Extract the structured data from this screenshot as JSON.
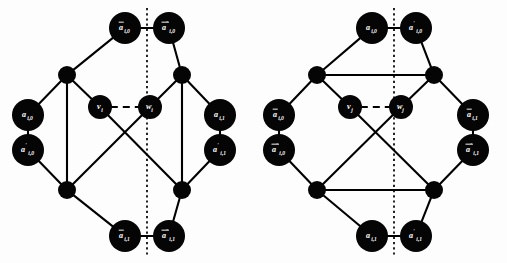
{
  "figure": {
    "kind": "graph-diagram-pair",
    "background_color": "#fdfdfd",
    "ink_color": "#000000",
    "node_fill": "#050505",
    "node_text_color": "#ffffff",
    "gadget_count": 2
  },
  "gadgets": [
    {
      "id": "left",
      "name": "variable-gadget-i",
      "center_subscript": "i",
      "connector_orientation": "vertical",
      "axis": {
        "type": "dotted",
        "orientation": "vertical"
      },
      "nodes": [
        {
          "key": "top_left",
          "base": "a",
          "bar": true,
          "prime": false,
          "sub": "i,0",
          "label": "ā_{i,0}",
          "cx": 125,
          "cy": 28,
          "r": 16
        },
        {
          "key": "top_right",
          "base": "a",
          "bar": true,
          "prime": true,
          "sub": "i,0",
          "label": "ā'_{i,0}",
          "cx": 169,
          "cy": 28,
          "r": 16
        },
        {
          "key": "hub_top_left",
          "base": "",
          "bar": false,
          "prime": false,
          "sub": "",
          "label": "",
          "cx": 67,
          "cy": 75,
          "r": 9
        },
        {
          "key": "hub_top_right",
          "base": "",
          "bar": false,
          "prime": false,
          "sub": "",
          "label": "",
          "cx": 182,
          "cy": 75,
          "r": 9
        },
        {
          "key": "side_left_up",
          "base": "a",
          "bar": false,
          "prime": false,
          "sub": "i,0",
          "label": "a_{i,0}",
          "cx": 28,
          "cy": 115,
          "r": 16
        },
        {
          "key": "side_left_dn",
          "base": "a",
          "bar": false,
          "prime": true,
          "sub": "i,0",
          "label": "a'_{i,0}",
          "cx": 28,
          "cy": 150,
          "r": 16
        },
        {
          "key": "center_v",
          "base": "v",
          "bar": false,
          "prime": false,
          "sub": "i",
          "label": "v_i",
          "cx": 100,
          "cy": 107,
          "r": 12
        },
        {
          "key": "center_w",
          "base": "w",
          "bar": false,
          "prime": false,
          "sub": "i",
          "label": "w_i",
          "cx": 150,
          "cy": 107,
          "r": 12
        },
        {
          "key": "side_right_up",
          "base": "a",
          "bar": false,
          "prime": false,
          "sub": "i,1",
          "label": "a_{i,1}",
          "cx": 220,
          "cy": 115,
          "r": 16
        },
        {
          "key": "side_right_dn",
          "base": "a",
          "bar": false,
          "prime": true,
          "sub": "i,1",
          "label": "a'_{i,1}",
          "cx": 220,
          "cy": 150,
          "r": 16
        },
        {
          "key": "hub_bot_left",
          "base": "",
          "bar": false,
          "prime": false,
          "sub": "",
          "label": "",
          "cx": 67,
          "cy": 190,
          "r": 9
        },
        {
          "key": "hub_bot_right",
          "base": "",
          "bar": false,
          "prime": false,
          "sub": "",
          "label": "",
          "cx": 182,
          "cy": 190,
          "r": 9
        },
        {
          "key": "bot_left",
          "base": "a",
          "bar": true,
          "prime": false,
          "sub": "i,1",
          "label": "ā_{i,1}",
          "cx": 125,
          "cy": 236,
          "r": 16
        },
        {
          "key": "bot_right",
          "base": "a",
          "bar": true,
          "prime": true,
          "sub": "i,1",
          "label": "ā'_{i,1}",
          "cx": 169,
          "cy": 236,
          "r": 16
        }
      ],
      "edges": [
        {
          "from": "top_left",
          "to": "top_right",
          "style": "solid"
        },
        {
          "from": "top_left",
          "to": "hub_top_left",
          "style": "solid"
        },
        {
          "from": "top_right",
          "to": "hub_top_right",
          "style": "solid"
        },
        {
          "from": "hub_top_left",
          "to": "side_left_up",
          "style": "solid"
        },
        {
          "from": "hub_top_right",
          "to": "side_right_up",
          "style": "solid"
        },
        {
          "from": "side_left_up",
          "to": "side_left_dn",
          "style": "solid"
        },
        {
          "from": "side_right_up",
          "to": "side_right_dn",
          "style": "solid"
        },
        {
          "from": "side_left_dn",
          "to": "hub_bot_left",
          "style": "solid"
        },
        {
          "from": "side_right_dn",
          "to": "hub_bot_right",
          "style": "solid"
        },
        {
          "from": "hub_bot_left",
          "to": "bot_left",
          "style": "solid"
        },
        {
          "from": "hub_bot_right",
          "to": "bot_right",
          "style": "solid"
        },
        {
          "from": "bot_left",
          "to": "bot_right",
          "style": "solid"
        },
        {
          "from": "hub_top_left",
          "to": "hub_bot_left",
          "style": "solid"
        },
        {
          "from": "hub_top_right",
          "to": "hub_bot_right",
          "style": "solid"
        },
        {
          "from": "hub_top_left",
          "to": "center_v",
          "style": "solid"
        },
        {
          "from": "hub_top_right",
          "to": "center_w",
          "style": "solid"
        },
        {
          "from": "center_v",
          "to": "hub_bot_right",
          "style": "solid"
        },
        {
          "from": "center_w",
          "to": "hub_bot_left",
          "style": "solid"
        },
        {
          "from": "center_v",
          "to": "center_w",
          "style": "dashed"
        }
      ]
    },
    {
      "id": "right",
      "name": "variable-gadget-j",
      "center_subscript": "j",
      "connector_orientation": "horizontal",
      "axis": {
        "type": "dotted",
        "orientation": "vertical"
      },
      "nodes": [
        {
          "key": "top_left",
          "base": "a",
          "bar": false,
          "prime": false,
          "sub": "i,0",
          "label": "a_{i,0}",
          "cx": 118,
          "cy": 28,
          "r": 16
        },
        {
          "key": "top_right",
          "base": "a",
          "bar": false,
          "prime": true,
          "sub": "i,0",
          "label": "a'_{i,0}",
          "cx": 162,
          "cy": 28,
          "r": 16
        },
        {
          "key": "hub_top_left",
          "base": "",
          "bar": false,
          "prime": false,
          "sub": "",
          "label": "",
          "cx": 63,
          "cy": 75,
          "r": 9
        },
        {
          "key": "hub_top_right",
          "base": "",
          "bar": false,
          "prime": false,
          "sub": "",
          "label": "",
          "cx": 180,
          "cy": 75,
          "r": 9
        },
        {
          "key": "side_left_up",
          "base": "a",
          "bar": true,
          "prime": false,
          "sub": "i,0",
          "label": "ā_{i,0}",
          "cx": 25,
          "cy": 115,
          "r": 16
        },
        {
          "key": "side_left_dn",
          "base": "a",
          "bar": true,
          "prime": true,
          "sub": "i,0",
          "label": "ā'_{i,0}",
          "cx": 25,
          "cy": 150,
          "r": 16
        },
        {
          "key": "center_v",
          "base": "v",
          "bar": false,
          "prime": false,
          "sub": "j",
          "label": "v_j",
          "cx": 96,
          "cy": 107,
          "r": 12
        },
        {
          "key": "center_w",
          "base": "w",
          "bar": false,
          "prime": false,
          "sub": "j",
          "label": "w_j",
          "cx": 147,
          "cy": 107,
          "r": 12
        },
        {
          "key": "side_right_up",
          "base": "a",
          "bar": true,
          "prime": false,
          "sub": "i,1",
          "label": "ā_{i,1}",
          "cx": 219,
          "cy": 115,
          "r": 16
        },
        {
          "key": "side_right_dn",
          "base": "a",
          "bar": true,
          "prime": true,
          "sub": "i,1",
          "label": "ā'_{i,1}",
          "cx": 219,
          "cy": 150,
          "r": 16
        },
        {
          "key": "hub_bot_left",
          "base": "",
          "bar": false,
          "prime": false,
          "sub": "",
          "label": "",
          "cx": 63,
          "cy": 190,
          "r": 9
        },
        {
          "key": "hub_bot_right",
          "base": "",
          "bar": false,
          "prime": false,
          "sub": "",
          "label": "",
          "cx": 180,
          "cy": 190,
          "r": 9
        },
        {
          "key": "bot_left",
          "base": "a",
          "bar": false,
          "prime": false,
          "sub": "i,1",
          "label": "a_{i,1}",
          "cx": 118,
          "cy": 236,
          "r": 16
        },
        {
          "key": "bot_right",
          "base": "a",
          "bar": false,
          "prime": true,
          "sub": "i,1",
          "label": "a'_{i,1}",
          "cx": 162,
          "cy": 236,
          "r": 16
        }
      ],
      "edges": [
        {
          "from": "top_left",
          "to": "top_right",
          "style": "solid"
        },
        {
          "from": "top_left",
          "to": "hub_top_left",
          "style": "solid"
        },
        {
          "from": "top_right",
          "to": "hub_top_right",
          "style": "solid"
        },
        {
          "from": "hub_top_left",
          "to": "side_left_up",
          "style": "solid"
        },
        {
          "from": "hub_top_right",
          "to": "side_right_up",
          "style": "solid"
        },
        {
          "from": "side_left_up",
          "to": "side_left_dn",
          "style": "solid"
        },
        {
          "from": "side_right_up",
          "to": "side_right_dn",
          "style": "solid"
        },
        {
          "from": "side_left_dn",
          "to": "hub_bot_left",
          "style": "solid"
        },
        {
          "from": "side_right_dn",
          "to": "hub_bot_right",
          "style": "solid"
        },
        {
          "from": "hub_bot_left",
          "to": "bot_left",
          "style": "solid"
        },
        {
          "from": "hub_bot_right",
          "to": "bot_right",
          "style": "solid"
        },
        {
          "from": "bot_left",
          "to": "bot_right",
          "style": "solid"
        },
        {
          "from": "hub_top_left",
          "to": "hub_top_right",
          "style": "solid"
        },
        {
          "from": "hub_bot_left",
          "to": "hub_bot_right",
          "style": "solid"
        },
        {
          "from": "hub_top_left",
          "to": "center_v",
          "style": "solid"
        },
        {
          "from": "hub_top_right",
          "to": "center_w",
          "style": "solid"
        },
        {
          "from": "center_v",
          "to": "hub_bot_right",
          "style": "solid"
        },
        {
          "from": "center_w",
          "to": "hub_bot_left",
          "style": "solid"
        },
        {
          "from": "center_v",
          "to": "center_w",
          "style": "dashed"
        }
      ]
    }
  ]
}
